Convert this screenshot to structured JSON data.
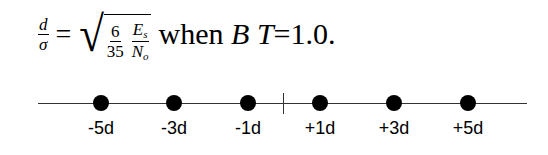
{
  "equation": {
    "lhs": {
      "num": "d",
      "den": "σ"
    },
    "equals": "=",
    "sqrt_content": {
      "frac1": {
        "num": "6",
        "den": "35"
      },
      "frac2": {
        "num_base": "E",
        "num_sub": "s",
        "den_base": "N",
        "den_sub": "o"
      }
    },
    "when": "when",
    "var1": "B",
    "var2": "T",
    "condition": "=1.0."
  },
  "number_line": {
    "points": [
      {
        "label": "-5d",
        "x": 101
      },
      {
        "label": "-3d",
        "x": 174
      },
      {
        "label": "-1d",
        "x": 248
      },
      {
        "label": "+1d",
        "x": 320
      },
      {
        "label": "+3d",
        "x": 394
      },
      {
        "label": "+5d",
        "x": 468
      }
    ],
    "origin_tick_x": 283
  }
}
